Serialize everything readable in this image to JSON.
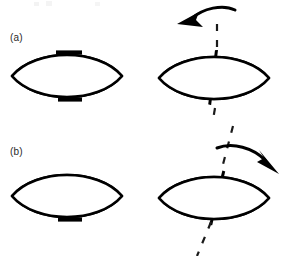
{
  "figure": {
    "background_color": "#ffffff",
    "ink_color": "#000000",
    "iris_fill_color": "#d8d8d8",
    "pupil_color": "#000000",
    "width": 289,
    "height": 256
  },
  "panels": [
    {
      "id": "a",
      "label": "(a)",
      "label_x": 10,
      "label_y": 32,
      "eyes": [
        {
          "role": "reference-eye",
          "name": "panel-a-left-eye",
          "position": "left",
          "cx": 72,
          "cy": 76,
          "half_width": 60,
          "half_height": 28,
          "iris_radius": 28,
          "pupil_radius": 14,
          "marker_line": null,
          "marker_rotation_deg": 0,
          "has_upper_lid_tick": true,
          "has_lower_lid_tick": true,
          "dashed_axis": false,
          "arrow": null
        },
        {
          "role": "rotated-eye",
          "name": "panel-a-right-eye",
          "position": "right",
          "cx": 217,
          "cy": 78,
          "half_width": 60,
          "half_height": 28,
          "iris_radius": 28,
          "pupil_radius": 15,
          "marker_line": "vertical-meridian",
          "marker_rotation_deg": -7,
          "has_upper_lid_tick": false,
          "has_lower_lid_tick": false,
          "dashed_axis": true,
          "dashed_axis_rotation_deg": 0,
          "arrow": {
            "name": "rotation-arrow-counterclockwise",
            "direction": "counterclockwise",
            "points_to": "upper-left"
          }
        }
      ]
    },
    {
      "id": "b",
      "label": "(b)",
      "label_x": 10,
      "label_y": 146,
      "eyes": [
        {
          "role": "reference-eye",
          "name": "panel-b-left-eye",
          "position": "left",
          "cx": 72,
          "cy": 196,
          "half_width": 60,
          "half_height": 28,
          "iris_radius": 28,
          "pupil_radius": 14,
          "marker_line": null,
          "marker_rotation_deg": 0,
          "has_upper_lid_tick": false,
          "has_lower_lid_tick": true,
          "dashed_axis": false,
          "arrow": null
        },
        {
          "role": "rotated-eye",
          "name": "panel-b-right-eye",
          "position": "right",
          "cx": 217,
          "cy": 198,
          "half_width": 60,
          "half_height": 28,
          "iris_radius": 28,
          "pupil_radius": 16,
          "marker_line": "vertical-meridian",
          "marker_rotation_deg": 12,
          "has_upper_lid_tick": false,
          "has_lower_lid_tick": false,
          "dashed_axis": true,
          "dashed_axis_rotation_deg": 12,
          "arrow": {
            "name": "rotation-arrow-clockwise",
            "direction": "clockwise",
            "points_to": "lower-right"
          }
        }
      ]
    }
  ]
}
